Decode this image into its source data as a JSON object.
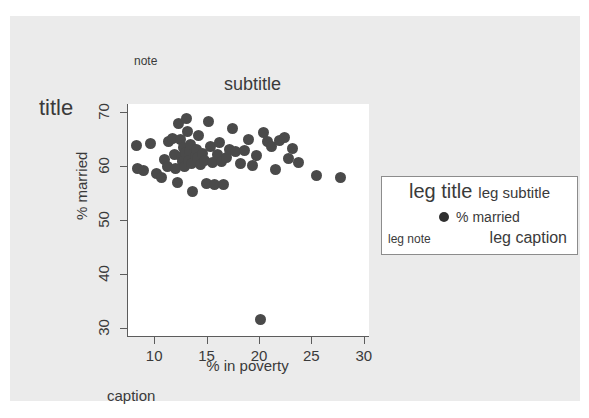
{
  "figure": {
    "background_color": "#ebebeb",
    "panel_color": "#ffffff",
    "marker_color": "#4a4a4a",
    "axis_color": "#5c5c5c",
    "title": "title",
    "subtitle": "subtitle",
    "note": "note",
    "caption": "caption"
  },
  "legend": {
    "title": "leg title",
    "subtitle": "leg subtitle",
    "key_label": "% married",
    "note": "leg note",
    "caption": "leg caption"
  },
  "chart_data": {
    "type": "scatter",
    "title": "title",
    "subtitle": "subtitle",
    "note": "note",
    "caption": "caption",
    "xlabel": "% in poverty",
    "ylabel": "% married",
    "xlim": [
      7.5,
      30.5
    ],
    "ylim": [
      28.5,
      71.5
    ],
    "xticks": [
      10,
      15,
      20,
      25,
      30
    ],
    "yticks": [
      30,
      40,
      50,
      60,
      70
    ],
    "xtick_labels": [
      "10",
      "15",
      "20",
      "25",
      "30"
    ],
    "ytick_labels": [
      "30",
      "40",
      "50",
      "60",
      "70"
    ],
    "grid": false,
    "legend_position": "right-middle",
    "series": [
      {
        "name": "% married",
        "marker": "filled-circle",
        "color": "#4a4a4a",
        "points": [
          [
            8.3,
            63.8
          ],
          [
            8.4,
            59.5
          ],
          [
            9.0,
            59.2
          ],
          [
            9.6,
            64.2
          ],
          [
            10.2,
            58.6
          ],
          [
            10.7,
            57.9
          ],
          [
            11.0,
            61.3
          ],
          [
            11.3,
            60.0
          ],
          [
            11.4,
            64.5
          ],
          [
            11.7,
            65.1
          ],
          [
            11.9,
            62.2
          ],
          [
            12.0,
            59.6
          ],
          [
            12.2,
            57.0
          ],
          [
            12.3,
            67.8
          ],
          [
            12.5,
            64.9
          ],
          [
            12.6,
            61.8
          ],
          [
            12.7,
            60.8
          ],
          [
            12.8,
            63.4
          ],
          [
            12.9,
            59.9
          ],
          [
            13.0,
            62.5
          ],
          [
            13.1,
            68.8
          ],
          [
            13.2,
            66.4
          ],
          [
            13.3,
            61.0
          ],
          [
            13.4,
            62.8
          ],
          [
            13.5,
            64.0
          ],
          [
            13.6,
            60.4
          ],
          [
            13.7,
            55.3
          ],
          [
            13.9,
            62.0
          ],
          [
            14.0,
            63.1
          ],
          [
            14.1,
            61.5
          ],
          [
            14.2,
            65.6
          ],
          [
            14.4,
            60.2
          ],
          [
            14.6,
            62.4
          ],
          [
            14.8,
            61.1
          ],
          [
            15.0,
            56.8
          ],
          [
            15.2,
            68.2
          ],
          [
            15.4,
            63.6
          ],
          [
            15.6,
            60.7
          ],
          [
            15.8,
            56.5
          ],
          [
            16.0,
            62.1
          ],
          [
            16.2,
            64.3
          ],
          [
            16.4,
            60.9
          ],
          [
            16.6,
            56.6
          ],
          [
            16.9,
            61.6
          ],
          [
            17.2,
            63.0
          ],
          [
            17.5,
            66.9
          ],
          [
            17.8,
            62.7
          ],
          [
            18.2,
            60.5
          ],
          [
            18.6,
            62.9
          ],
          [
            19.0,
            65.0
          ],
          [
            19.4,
            60.1
          ],
          [
            19.8,
            61.9
          ],
          [
            20.1,
            31.5
          ],
          [
            20.4,
            66.3
          ],
          [
            20.8,
            64.6
          ],
          [
            21.2,
            63.7
          ],
          [
            21.6,
            59.3
          ],
          [
            22.0,
            64.8
          ],
          [
            22.4,
            65.2
          ],
          [
            22.8,
            61.4
          ],
          [
            23.2,
            63.3
          ],
          [
            23.8,
            60.6
          ],
          [
            25.5,
            58.2
          ],
          [
            27.8,
            57.9
          ]
        ]
      }
    ]
  }
}
